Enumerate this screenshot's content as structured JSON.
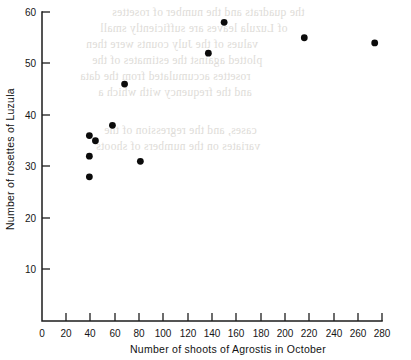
{
  "chart_data": {
    "type": "scatter",
    "title": "",
    "xlabel": "Number of shoots of Agrostis in October",
    "ylabel": "Number of rosettes of Luzula",
    "xlim": [
      0,
      280
    ],
    "ylim": [
      0,
      60
    ],
    "xticks": [
      0,
      20,
      40,
      60,
      80,
      100,
      120,
      140,
      160,
      180,
      200,
      220,
      240,
      260,
      280
    ],
    "yticks": [
      0,
      10,
      20,
      30,
      40,
      50,
      60
    ],
    "xtick_labels": [
      "0",
      "20",
      "40",
      "60",
      "80",
      "100",
      "120",
      "140",
      "160",
      "180",
      "200",
      "220",
      "240",
      "260",
      "280"
    ],
    "ytick_labels": [
      "",
      "10",
      "20",
      "30",
      "40",
      "50",
      "60"
    ],
    "grid": false,
    "legend": null,
    "marker": "filled-circle",
    "marker_color": "#0b0b0b",
    "points": [
      {
        "x": 39,
        "y": 36
      },
      {
        "x": 44,
        "y": 35
      },
      {
        "x": 39,
        "y": 32
      },
      {
        "x": 39,
        "y": 28
      },
      {
        "x": 58,
        "y": 38
      },
      {
        "x": 68,
        "y": 46
      },
      {
        "x": 81,
        "y": 31
      },
      {
        "x": 137,
        "y": 52
      },
      {
        "x": 150,
        "y": 58
      },
      {
        "x": 216,
        "y": 55
      },
      {
        "x": 274,
        "y": 54
      }
    ]
  },
  "figure": {
    "background_color": "#ffffff",
    "axis_color": "#1c1c1c"
  },
  "bleed_through": {
    "note": "Faint mirrored text showing through from the reverse side of the printed page",
    "lines": [
      "the quadrats and the number of rosettes",
      "of Luzula leaves are sufficiently small",
      "values of the July counts were then",
      "plotted against the estimates of the",
      "rosettes accumulated from the data",
      "and the frequency with which a",
      "",
      "cases, and the regression of the",
      "variates on the numbers of shoots"
    ]
  }
}
